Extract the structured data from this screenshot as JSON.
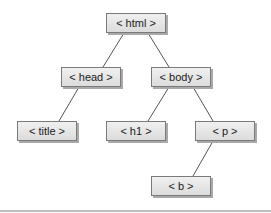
{
  "diagram": {
    "type": "tree",
    "nodes": [
      {
        "id": "html",
        "label": "< html >",
        "parent": null
      },
      {
        "id": "head",
        "label": "< head >",
        "parent": "html"
      },
      {
        "id": "body",
        "label": "< body >",
        "parent": "html"
      },
      {
        "id": "title",
        "label": "< title >",
        "parent": "head"
      },
      {
        "id": "h1",
        "label": "< h1 >",
        "parent": "body"
      },
      {
        "id": "p",
        "label": "< p >",
        "parent": "body"
      },
      {
        "id": "b",
        "label": "< b >",
        "parent": "p"
      }
    ],
    "edges": [
      {
        "from": "html",
        "to": "head"
      },
      {
        "from": "html",
        "to": "body"
      },
      {
        "from": "head",
        "to": "title"
      },
      {
        "from": "body",
        "to": "h1"
      },
      {
        "from": "body",
        "to": "p"
      },
      {
        "from": "p",
        "to": "b"
      }
    ],
    "colors": {
      "edge": "#555555",
      "node_border": "#7a7a7a",
      "node_fill_top": "#f0f0f0",
      "node_fill_bottom": "#dcdcdc",
      "text": "#222222"
    }
  }
}
